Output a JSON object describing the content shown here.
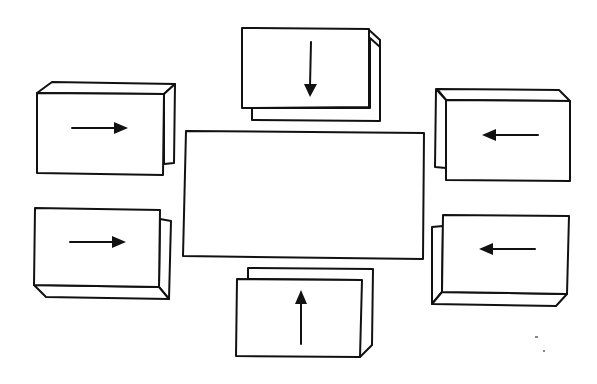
{
  "diagram": {
    "title": "",
    "colors": {
      "stroke": "#111111",
      "fill": "#ffffff",
      "background": "#ffffff"
    },
    "center_box": {
      "label": "",
      "x1": 185,
      "y1": 130,
      "x2": 424,
      "y2": 259
    },
    "boxes": [
      {
        "id": "top",
        "label": "",
        "arrow_direction": "down",
        "icon": "arrow-down-icon"
      },
      {
        "id": "top-left",
        "label": "",
        "arrow_direction": "right",
        "icon": "arrow-right-icon"
      },
      {
        "id": "top-right",
        "label": "",
        "arrow_direction": "left",
        "icon": "arrow-left-icon"
      },
      {
        "id": "bottom-left",
        "label": "",
        "arrow_direction": "right",
        "icon": "arrow-right-icon"
      },
      {
        "id": "bottom-right",
        "label": "",
        "arrow_direction": "left",
        "icon": "arrow-left-icon"
      },
      {
        "id": "bottom",
        "label": "",
        "arrow_direction": "up",
        "icon": "arrow-up-icon"
      }
    ]
  }
}
